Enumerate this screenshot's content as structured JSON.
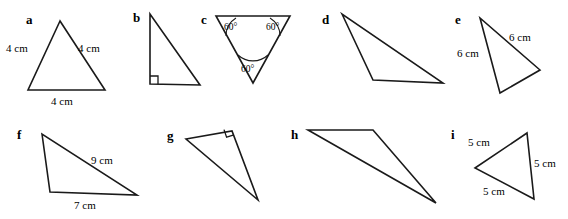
{
  "page": {
    "background_color": "#ffffff",
    "stroke_color": "#1a1a1a",
    "text_color": "#000000",
    "width": 568,
    "height": 219
  },
  "items": [
    {
      "letter": "a",
      "letter_x": 26,
      "letter_y": 24,
      "shape": "triangle",
      "points": "60,21 28,90 105,90",
      "labels": [
        {
          "text": "4 cm",
          "x": 6,
          "y": 52
        },
        {
          "text": "4 cm",
          "x": 78,
          "y": 52
        },
        {
          "text": "4 cm",
          "x": 51,
          "y": 105
        }
      ],
      "right_angle": null,
      "angle_arcs": []
    },
    {
      "letter": "b",
      "letter_x": 133,
      "letter_y": 22,
      "shape": "triangle",
      "points": "150,14 150,84 200,85",
      "labels": [],
      "right_angle": {
        "path": "M 150,76 L 158,76 L 158,84.2"
      },
      "angle_arcs": []
    },
    {
      "letter": "c",
      "letter_x": 201,
      "letter_y": 24,
      "shape": "triangle",
      "points": "216,16 290,16 253,83",
      "labels": [],
      "right_angle": null,
      "angle_arcs": [
        {
          "path": "M 236,18 A 21,21 0 0 0 226,36",
          "label": "60°",
          "label_x": 224,
          "label_y": 30
        },
        {
          "path": "M 280,36 A 21,21 0 0 0 270,18",
          "label": "60°",
          "label_x": 266,
          "label_y": 30
        },
        {
          "path": "M 238,55 A 22,22 0 0 0 268,55",
          "label": "60°",
          "label_x": 241,
          "label_y": 72
        }
      ]
    },
    {
      "letter": "d",
      "letter_x": 322,
      "letter_y": 24,
      "shape": "triangle",
      "points": "342,14 373,80 443,83",
      "labels": [],
      "right_angle": null,
      "angle_arcs": []
    },
    {
      "letter": "e",
      "letter_x": 455,
      "letter_y": 24,
      "shape": "triangle",
      "points": "480,18 500,93 540,70",
      "labels": [
        {
          "text": "6 cm",
          "x": 457,
          "y": 57
        },
        {
          "text": "6 cm",
          "x": 509,
          "y": 41
        }
      ],
      "right_angle": null,
      "angle_arcs": []
    },
    {
      "letter": "f",
      "letter_x": 17,
      "letter_y": 139,
      "shape": "triangle",
      "points": "42,134 50,192 137,195",
      "labels": [
        {
          "text": "9 cm",
          "x": 91,
          "y": 164
        },
        {
          "text": "7 cm",
          "x": 74,
          "y": 209
        }
      ],
      "right_angle": null,
      "angle_arcs": []
    },
    {
      "letter": "g",
      "letter_x": 167,
      "letter_y": 140,
      "shape": "triangle",
      "points": "186,139 232,131 258,200",
      "labels": [],
      "right_angle": {
        "path": "M 224,129.6 L 226.6,137.2 L 234,134.8"
      },
      "angle_arcs": []
    },
    {
      "letter": "h",
      "letter_x": 291,
      "letter_y": 139,
      "shape": "triangle",
      "points": "308,130 373,130 436,203",
      "labels": [],
      "right_angle": null,
      "angle_arcs": []
    },
    {
      "letter": "i",
      "letter_x": 451,
      "letter_y": 139,
      "shape": "triangle",
      "points": "475,168 527,133 534,199",
      "labels": [
        {
          "text": "5 cm",
          "x": 468,
          "y": 146
        },
        {
          "text": "5 cm",
          "x": 534,
          "y": 167
        },
        {
          "text": "5 cm",
          "x": 483,
          "y": 195
        }
      ],
      "right_angle": null,
      "angle_arcs": []
    }
  ]
}
